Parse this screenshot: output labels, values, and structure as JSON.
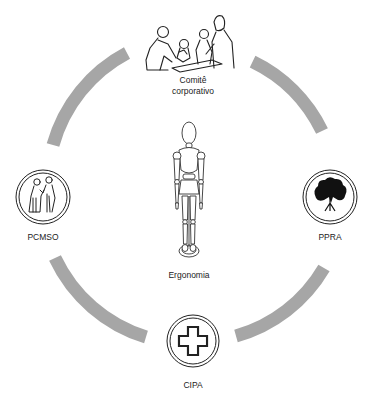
{
  "diagram": {
    "type": "cycle",
    "arc_color": "#a6a6a6",
    "line_color": "#222222",
    "center": {
      "label": "Ergonomia",
      "icon": "wooden-mannequin-icon"
    },
    "nodes": [
      {
        "id": "comite",
        "label_line1": "Comitê",
        "label_line2": "corporativo",
        "icon": "meeting-people-icon",
        "position": "top"
      },
      {
        "id": "pcmso",
        "label": "PCMSO",
        "icon": "doctor-patient-icon",
        "position": "left"
      },
      {
        "id": "ppra",
        "label": "PPRA",
        "icon": "tree-icon",
        "position": "right"
      },
      {
        "id": "cipa",
        "label": "CIPA",
        "icon": "cross-icon",
        "position": "bottom"
      }
    ],
    "connectors": [
      {
        "from": "comite",
        "to": "ppra"
      },
      {
        "from": "ppra",
        "to": "cipa"
      },
      {
        "from": "cipa",
        "to": "pcmso"
      },
      {
        "from": "pcmso",
        "to": "comite"
      }
    ]
  }
}
